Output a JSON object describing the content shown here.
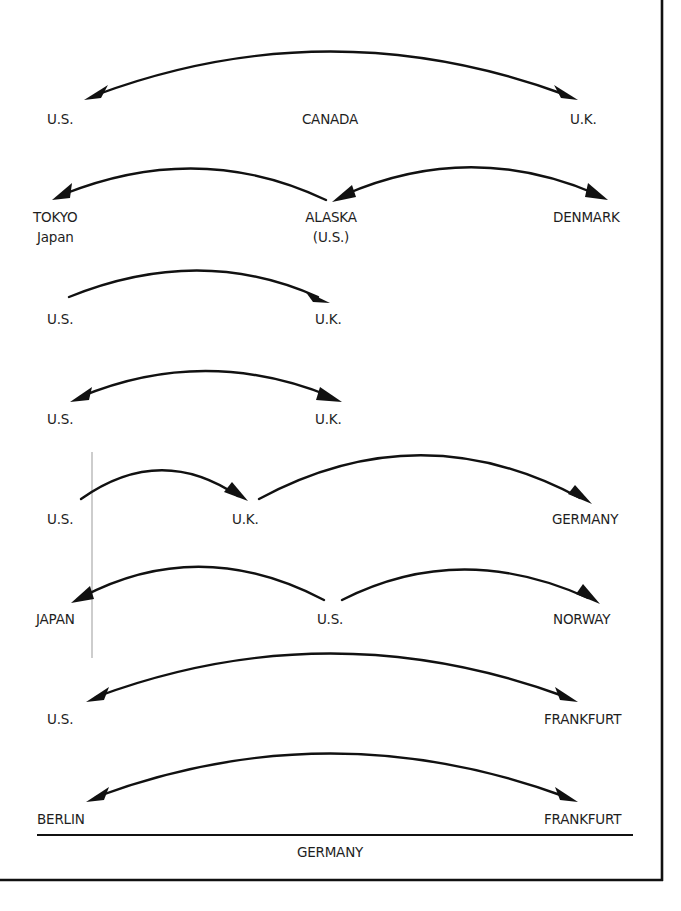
{
  "diagram": {
    "type": "flow-arrows",
    "colors": {
      "ink": "#111111",
      "text": "#1e1e1e",
      "guide": "#b8b8b8",
      "background": "#ffffff"
    },
    "rows": [
      {
        "id": "row1",
        "labels": [
          "U.S.",
          "CANADA",
          "U.K."
        ],
        "arrows": [
          {
            "from": "U.S.",
            "to": "U.K.",
            "heads": "both"
          }
        ]
      },
      {
        "id": "row2",
        "labels": [
          "TOKYO",
          "Japan",
          "ALASKA",
          "(U.S.)",
          "DENMARK"
        ],
        "arrows": [
          {
            "from": "ALASKA (U.S.)",
            "to": "TOKYO Japan",
            "heads": "end"
          },
          {
            "from": "ALASKA (U.S.)",
            "to": "DENMARK",
            "heads": "both"
          }
        ]
      },
      {
        "id": "row3",
        "labels": [
          "U.S.",
          "U.K."
        ],
        "arrows": [
          {
            "from": "U.S.",
            "to": "U.K.",
            "heads": "end"
          }
        ]
      },
      {
        "id": "row4",
        "labels": [
          "U.S.",
          "U.K."
        ],
        "arrows": [
          {
            "from": "U.S.",
            "to": "U.K.",
            "heads": "both"
          }
        ]
      },
      {
        "id": "row5",
        "labels": [
          "U.S.",
          "U.K.",
          "GERMANY"
        ],
        "arrows": [
          {
            "from": "U.S.",
            "to": "U.K.",
            "heads": "end"
          },
          {
            "from": "U.K.",
            "to": "GERMANY",
            "heads": "end"
          }
        ]
      },
      {
        "id": "row6",
        "labels": [
          "JAPAN",
          "U.S.",
          "NORWAY"
        ],
        "arrows": [
          {
            "from": "U.S.",
            "to": "JAPAN",
            "heads": "end"
          },
          {
            "from": "U.S.",
            "to": "NORWAY",
            "heads": "end"
          }
        ]
      },
      {
        "id": "row7",
        "labels": [
          "U.S.",
          "FRANKFURT"
        ],
        "arrows": [
          {
            "from": "U.S.",
            "to": "FRANKFURT",
            "heads": "both"
          }
        ]
      },
      {
        "id": "row8",
        "labels": [
          "BERLIN",
          "FRANKFURT"
        ],
        "arrows": [
          {
            "from": "BERLIN",
            "to": "FRANKFURT",
            "heads": "both"
          }
        ],
        "group_label": "GERMANY"
      }
    ]
  }
}
